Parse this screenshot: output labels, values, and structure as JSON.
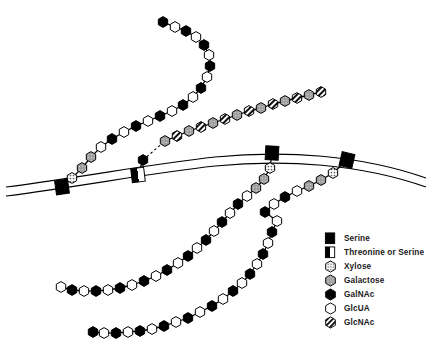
{
  "figure": {
    "width": 432,
    "height": 357,
    "background_color": "#ffffff",
    "line_color": "#000000"
  },
  "membrane": {
    "name": "cell-membrane",
    "style": "two parallel curved lines",
    "outer_path": "M 6 187 C 90 176 150 164 215 157 C 285 150 360 155 426 178",
    "inner_path": "M 6 196 C 90 185 150 173 215 166 C 285 159 360 164 426 187",
    "stroke_width": 1.2
  },
  "legend": {
    "name": "symbol-legend",
    "items": [
      {
        "label": "Serine",
        "symbol": "filled-square",
        "shape": "square",
        "fill": "#000000"
      },
      {
        "label": "Threonine or Serine",
        "symbol": "half-filled-square",
        "shape": "square",
        "fill": "half"
      },
      {
        "label": "Xylose",
        "symbol": "dotted-hexagon",
        "shape": "hexagon",
        "fill": "dotted"
      },
      {
        "label": "Galactose",
        "symbol": "gray-hexagon",
        "shape": "hexagon",
        "fill": "#9a9a9a"
      },
      {
        "label": "GalNAc",
        "symbol": "filled-hexagon",
        "shape": "hexagon",
        "fill": "#000000"
      },
      {
        "label": "GlcUA",
        "symbol": "open-hexagon",
        "shape": "hexagon",
        "fill": "#ffffff"
      },
      {
        "label": "GlcNAc",
        "symbol": "striped-hexagon",
        "shape": "hexagon",
        "fill": "diagonal-stripe"
      }
    ]
  },
  "anchors": [
    {
      "name": "anchor-serine-left",
      "type": "Serine",
      "x": 62,
      "y": 187,
      "rotation": -8
    },
    {
      "name": "anchor-threonine-or-serine",
      "type": "Threonine or Serine",
      "x": 138,
      "y": 175,
      "rotation": -7
    },
    {
      "name": "anchor-serine-mid-right",
      "type": "Serine",
      "x": 272,
      "y": 153,
      "rotation": 3
    },
    {
      "name": "anchor-serine-far-right",
      "type": "Serine",
      "x": 347,
      "y": 160,
      "rotation": 13
    }
  ],
  "chains": [
    {
      "name": "chain-chondroitin-sulfate-left",
      "anchor": "anchor-serine-left",
      "description": "Serine linked via Xylose-Galactose-Galactose to alternating GlcUA/GalNAc repeats",
      "residues": [
        {
          "type": "Xylose",
          "x": 72,
          "y": 178
        },
        {
          "type": "Galactose",
          "x": 82,
          "y": 168
        },
        {
          "type": "Galactose",
          "x": 91,
          "y": 157
        },
        {
          "type": "GlcUA",
          "x": 101,
          "y": 147
        },
        {
          "type": "GalNAc",
          "x": 112,
          "y": 139
        },
        {
          "type": "GlcUA",
          "x": 124,
          "y": 132
        },
        {
          "type": "GalNAc",
          "x": 136,
          "y": 126
        },
        {
          "type": "GlcUA",
          "x": 148,
          "y": 121
        },
        {
          "type": "GalNAc",
          "x": 160,
          "y": 116
        },
        {
          "type": "GlcUA",
          "x": 172,
          "y": 111
        },
        {
          "type": "GalNAc",
          "x": 183,
          "y": 105
        },
        {
          "type": "GlcUA",
          "x": 193,
          "y": 97
        },
        {
          "type": "GalNAc",
          "x": 201,
          "y": 88
        },
        {
          "type": "GlcUA",
          "x": 207,
          "y": 77
        },
        {
          "type": "GalNAc",
          "x": 210,
          "y": 66
        },
        {
          "type": "GlcUA",
          "x": 209,
          "y": 55
        },
        {
          "type": "GalNAc",
          "x": 204,
          "y": 45
        },
        {
          "type": "GlcUA",
          "x": 196,
          "y": 37
        },
        {
          "type": "GalNAc",
          "x": 186,
          "y": 31
        },
        {
          "type": "GlcUA",
          "x": 175,
          "y": 27
        },
        {
          "type": "GalNAc",
          "x": 163,
          "y": 22
        }
      ]
    },
    {
      "name": "chain-keratan-sulfate",
      "anchor": "anchor-threonine-or-serine",
      "description": "Threonine or Serine linked to GalNAc, then a dashed linkage to alternating Galactose/GlcNAc repeats",
      "linker_dashed": true,
      "residues": [
        {
          "type": "GalNAc",
          "x": 143,
          "y": 160,
          "linker": "solid"
        },
        {
          "type": "Galactose",
          "x": 165,
          "y": 141,
          "linker": "dashed"
        },
        {
          "type": "GlcNAc",
          "x": 177,
          "y": 136
        },
        {
          "type": "Galactose",
          "x": 189,
          "y": 131
        },
        {
          "type": "GlcNAc",
          "x": 201,
          "y": 127
        },
        {
          "type": "Galactose",
          "x": 213,
          "y": 123
        },
        {
          "type": "GlcNAc",
          "x": 225,
          "y": 119
        },
        {
          "type": "Galactose",
          "x": 237,
          "y": 115
        },
        {
          "type": "GlcNAc",
          "x": 249,
          "y": 111
        },
        {
          "type": "Galactose",
          "x": 261,
          "y": 108
        },
        {
          "type": "GlcNAc",
          "x": 273,
          "y": 104
        },
        {
          "type": "Galactose",
          "x": 285,
          "y": 101
        },
        {
          "type": "GlcNAc",
          "x": 297,
          "y": 98
        },
        {
          "type": "Galactose",
          "x": 309,
          "y": 95
        },
        {
          "type": "GlcNAc",
          "x": 321,
          "y": 92
        }
      ]
    },
    {
      "name": "chain-chondroitin-sulfate-mid-right",
      "anchor": "anchor-serine-mid-right",
      "description": "Serine linked via Xylose-Galactose-Galactose to alternating GlcUA/GalNAc repeats descending left",
      "residues": [
        {
          "type": "Xylose",
          "x": 270,
          "y": 168
        },
        {
          "type": "Galactose",
          "x": 264,
          "y": 179
        },
        {
          "type": "Galactose",
          "x": 256,
          "y": 188
        },
        {
          "type": "GlcUA",
          "x": 247,
          "y": 196
        },
        {
          "type": "GalNAc",
          "x": 238,
          "y": 204
        },
        {
          "type": "GlcUA",
          "x": 230,
          "y": 213
        },
        {
          "type": "GalNAc",
          "x": 222,
          "y": 222
        },
        {
          "type": "GlcUA",
          "x": 214,
          "y": 231
        },
        {
          "type": "GalNAc",
          "x": 206,
          "y": 240
        },
        {
          "type": "GlcUA",
          "x": 197,
          "y": 248
        },
        {
          "type": "GalNAc",
          "x": 188,
          "y": 256
        },
        {
          "type": "GlcUA",
          "x": 178,
          "y": 263
        },
        {
          "type": "GalNAc",
          "x": 167,
          "y": 270
        },
        {
          "type": "GlcUA",
          "x": 156,
          "y": 276
        },
        {
          "type": "GalNAc",
          "x": 144,
          "y": 281
        },
        {
          "type": "GlcUA",
          "x": 132,
          "y": 285
        },
        {
          "type": "GalNAc",
          "x": 120,
          "y": 288
        },
        {
          "type": "GlcUA",
          "x": 108,
          "y": 290
        },
        {
          "type": "GalNAc",
          "x": 96,
          "y": 291
        },
        {
          "type": "GlcUA",
          "x": 84,
          "y": 291
        },
        {
          "type": "GalNAc",
          "x": 72,
          "y": 290
        },
        {
          "type": "GlcUA",
          "x": 61,
          "y": 287
        }
      ]
    },
    {
      "name": "chain-chondroitin-sulfate-far-right",
      "anchor": "anchor-serine-far-right",
      "description": "Serine linked via Xylose-Galactose-Galactose to alternating GlcUA/GalNAc repeats descending far left",
      "residues": [
        {
          "type": "Xylose",
          "x": 333,
          "y": 173
        },
        {
          "type": "Galactose",
          "x": 321,
          "y": 180
        },
        {
          "type": "Galactose",
          "x": 309,
          "y": 186
        },
        {
          "type": "GlcUA",
          "x": 297,
          "y": 191
        },
        {
          "type": "GalNAc",
          "x": 285,
          "y": 197
        },
        {
          "type": "GlcUA",
          "x": 274,
          "y": 204
        },
        {
          "type": "GalNAc",
          "x": 265,
          "y": 212
        },
        {
          "type": "GlcUA",
          "x": 277,
          "y": 221
        },
        {
          "type": "GalNAc",
          "x": 272,
          "y": 232
        },
        {
          "type": "GlcUA",
          "x": 268,
          "y": 243
        },
        {
          "type": "GalNAc",
          "x": 263,
          "y": 254
        },
        {
          "type": "GlcUA",
          "x": 257,
          "y": 264
        },
        {
          "type": "GalNAc",
          "x": 250,
          "y": 274
        },
        {
          "type": "GlcUA",
          "x": 242,
          "y": 283
        },
        {
          "type": "GalNAc",
          "x": 233,
          "y": 291
        },
        {
          "type": "GlcUA",
          "x": 223,
          "y": 299
        },
        {
          "type": "GalNAc",
          "x": 212,
          "y": 306
        },
        {
          "type": "GlcUA",
          "x": 200,
          "y": 312
        },
        {
          "type": "GalNAc",
          "x": 188,
          "y": 318
        },
        {
          "type": "GlcUA",
          "x": 176,
          "y": 322
        },
        {
          "type": "GalNAc",
          "x": 164,
          "y": 326
        },
        {
          "type": "GlcUA",
          "x": 152,
          "y": 329
        },
        {
          "type": "GalNAc",
          "x": 140,
          "y": 331
        },
        {
          "type": "GlcUA",
          "x": 128,
          "y": 332
        },
        {
          "type": "GalNAc",
          "x": 116,
          "y": 333
        },
        {
          "type": "GlcUA",
          "x": 104,
          "y": 333
        },
        {
          "type": "GalNAc",
          "x": 93,
          "y": 332
        }
      ]
    }
  ]
}
